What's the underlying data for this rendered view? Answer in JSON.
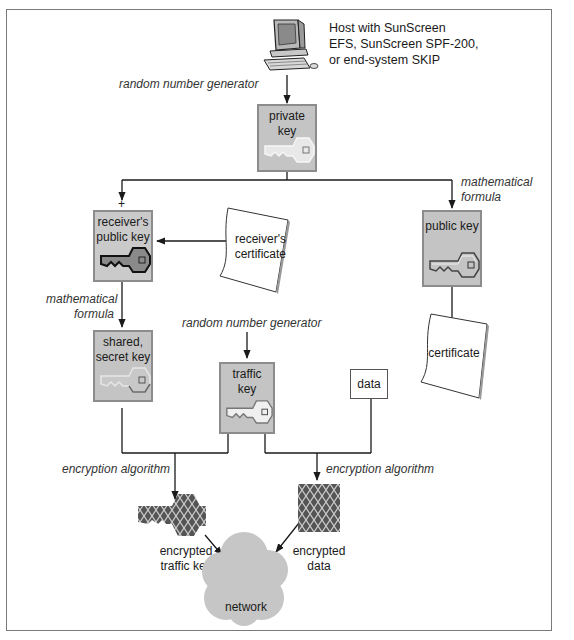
{
  "host": {
    "label_lines": [
      "Host with SunScreen",
      "EFS, SunScreen SPF-200,",
      "or end-system SKIP"
    ],
    "icon": "computer-icon"
  },
  "annotations": {
    "rng_top": "random number generator",
    "rng_middle": "random number generator",
    "math_formula_right": [
      "mathematical",
      "formula"
    ],
    "math_formula_left": [
      "mathematical",
      "formula"
    ],
    "encryption_left": "encryption algorithm",
    "encryption_right": "encryption algorithm",
    "plus_sign": "+"
  },
  "keys": {
    "private_key": [
      "private",
      "key"
    ],
    "receivers_public_key": [
      "receiver's",
      "public key"
    ],
    "public_key": [
      "public key"
    ],
    "shared_secret_key": [
      "shared,",
      "secret key"
    ],
    "traffic_key": [
      "traffic",
      "key"
    ]
  },
  "documents": {
    "receivers_certificate": [
      "receiver's",
      "certificate"
    ],
    "certificate": [
      "certificate"
    ],
    "data": "data"
  },
  "outputs": {
    "encrypted_traffic_key": [
      "encrypted",
      "traffic key"
    ],
    "encrypted_data": [
      "encrypted",
      "data"
    ],
    "network": "network"
  },
  "colors": {
    "key_box_fill": "#c4c4c4",
    "key_box_border": "#8c8c8c",
    "private_key_glyph": "#e4e4e4",
    "receiver_key_glyph": "#8a8a8a",
    "encrypted_fill": "#555555",
    "network_cloud": "#c6c6c6",
    "line": "#1a1a1a"
  }
}
